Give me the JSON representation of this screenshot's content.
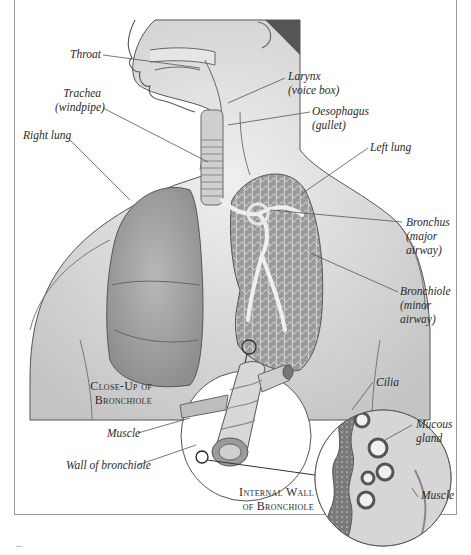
{
  "diagram": {
    "labels": {
      "throat": "Throat",
      "trachea": {
        "line1": "Trachea",
        "line2": "(windpipe)"
      },
      "right_lung": "Right lung",
      "larynx": {
        "line1": "Larynx",
        "line2": "(voice box)"
      },
      "oesophagus": {
        "line1": "Oesophagus",
        "line2": "(gullet)"
      },
      "left_lung": "Left lung",
      "bronchus": {
        "line1": "Bronchus",
        "line2": "(major",
        "line3": "airway)"
      },
      "bronchiole": {
        "line1": "Bronchiole",
        "line2": "(minor",
        "line3": "airway)"
      },
      "closeup_title": {
        "line1": "Close-Up of",
        "line2": "Bronchiole"
      },
      "muscle_closeup": "Muscle",
      "wall_of_bronchiole": "Wall of bronchiole",
      "internal_wall_title": {
        "line1": "Internal Wall",
        "line2": "of Bronchiole"
      },
      "cilia": "Cilia",
      "mucous_gland": {
        "line1": "Mucous",
        "line2": "gland"
      },
      "muscle_internal": "Muscle"
    },
    "colors": {
      "background": "#ffffff",
      "skin": "#d9d9d9",
      "lung": "#a8a8a8",
      "leader_line": "#555555",
      "frame": "#9a9a9a"
    }
  }
}
